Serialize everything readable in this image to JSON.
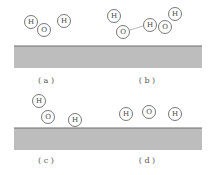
{
  "diagram": {
    "panels": [
      {
        "id": "a",
        "label": "( a )",
        "atoms": [
          {
            "symbol": "H",
            "x": 31,
            "y": 22
          },
          {
            "symbol": "O",
            "x": 44,
            "y": 30
          },
          {
            "symbol": "H",
            "x": 64,
            "y": 21
          }
        ],
        "bonds": []
      },
      {
        "id": "b",
        "label": "( b )",
        "atoms": [
          {
            "symbol": "H",
            "x": 114,
            "y": 16
          },
          {
            "symbol": "O",
            "x": 123,
            "y": 32
          },
          {
            "symbol": "H",
            "x": 150,
            "y": 25
          },
          {
            "symbol": "O",
            "x": 165,
            "y": 27
          },
          {
            "symbol": "H",
            "x": 175,
            "y": 14
          }
        ],
        "bonds": [
          {
            "from": [
              130,
              30
            ],
            "to": [
              143,
              26
            ]
          }
        ]
      },
      {
        "id": "c",
        "label": "( c )",
        "atoms": [
          {
            "symbol": "H",
            "x": 39,
            "y": 101
          },
          {
            "symbol": "O",
            "x": 48,
            "y": 117
          },
          {
            "symbol": "H",
            "x": 75,
            "y": 120
          }
        ],
        "bonds": []
      },
      {
        "id": "d",
        "label": "( d )",
        "atoms": [
          {
            "symbol": "H",
            "x": 126,
            "y": 114
          },
          {
            "symbol": "O",
            "x": 149,
            "y": 112
          },
          {
            "symbol": "H",
            "x": 175,
            "y": 114
          }
        ],
        "bonds": []
      }
    ],
    "surfaces": [
      {
        "x": 14,
        "y": 46,
        "width": 188,
        "height": 22
      },
      {
        "x": 14,
        "y": 128,
        "width": 188,
        "height": 22
      }
    ],
    "labels_pos": [
      {
        "id": "a",
        "x": 46,
        "y": 83
      },
      {
        "id": "b",
        "x": 147,
        "y": 83
      },
      {
        "id": "c",
        "x": 46,
        "y": 163
      },
      {
        "id": "d",
        "x": 147,
        "y": 163
      }
    ],
    "colors": {
      "surface": "#bdbdbd",
      "surface_edge": "#6e6e6e",
      "atom_stroke": "#555555"
    }
  }
}
